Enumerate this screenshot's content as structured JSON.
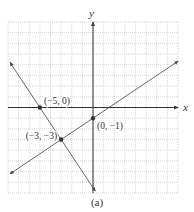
{
  "chart_data": {
    "type": "line",
    "title": "",
    "caption": "(a)",
    "xlabel": "x",
    "ylabel": "y",
    "xlim": [
      -8,
      8
    ],
    "ylim": [
      -8,
      8
    ],
    "grid": true,
    "grid_step": 1,
    "series": [
      {
        "name": "line through (−5, 0) and (−3, −3)",
        "equation": "y = -1.5x - 7.5",
        "x": [
          -7.8,
          0.2
        ],
        "y": [
          4.2,
          -7.8
        ]
      },
      {
        "name": "line through (0, −1) and (−3, −3)",
        "equation": "y = (2/3)x - 1",
        "x": [
          -7.8,
          8
        ],
        "y": [
          -6.2,
          4.33
        ]
      }
    ],
    "points": [
      {
        "label": "(−5, 0)",
        "x": -5,
        "y": 0
      },
      {
        "label": "(0, −1)",
        "x": 0,
        "y": -1
      },
      {
        "label": "(−3, −3)",
        "x": -3,
        "y": -3
      }
    ]
  }
}
